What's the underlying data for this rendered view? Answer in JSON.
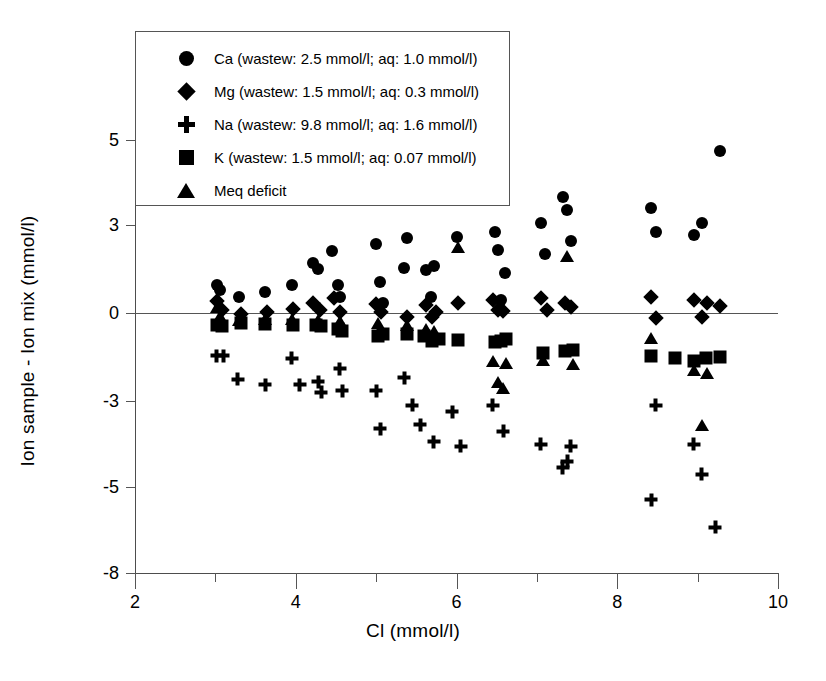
{
  "chart_data": {
    "type": "scatter",
    "title": "",
    "xlabel": "Cl (mmol/l)",
    "ylabel": "Ion sample - Ion mix  (mmol/l)",
    "xlim": [
      2,
      10
    ],
    "ylim": [
      -8,
      6
    ],
    "grid": false,
    "legend_position": "top-left",
    "xticks": [
      {
        "value": 2,
        "label": "2",
        "type": "major"
      },
      {
        "value": 3,
        "label": "",
        "type": "minor"
      },
      {
        "value": 4,
        "label": "4",
        "type": "major"
      },
      {
        "value": 5,
        "label": "",
        "type": "minor"
      },
      {
        "value": 6,
        "label": "6",
        "type": "major"
      },
      {
        "value": 7,
        "label": "",
        "type": "minor"
      },
      {
        "value": 8,
        "label": "8",
        "type": "major"
      },
      {
        "value": 9,
        "label": "",
        "type": "minor"
      },
      {
        "value": 10,
        "label": "10",
        "type": "major"
      }
    ],
    "yticks": [
      {
        "value": 5,
        "label": "5"
      },
      {
        "value": 3,
        "label": "3"
      },
      {
        "value": 0,
        "label": "0"
      },
      {
        "value": -3,
        "label": "-3"
      },
      {
        "value": -5,
        "label": "-5"
      },
      {
        "value": -8,
        "label": "-8"
      }
    ],
    "reference_lines": [
      {
        "axis": "y",
        "value": 0
      }
    ],
    "series": [
      {
        "name": "Ca",
        "marker": "circle",
        "legend_label": "Ca (wastew: 2.5 mmol/l; aq: 1.0 mmol/l)",
        "points": [
          [
            3.02,
            0.95
          ],
          [
            3.06,
            0.8
          ],
          [
            3.3,
            0.55
          ],
          [
            3.62,
            0.72
          ],
          [
            3.95,
            0.95
          ],
          [
            4.22,
            1.7
          ],
          [
            4.28,
            1.5
          ],
          [
            4.45,
            2.1
          ],
          [
            4.52,
            0.95
          ],
          [
            4.55,
            0.55
          ],
          [
            5.0,
            2.35
          ],
          [
            5.05,
            1.05
          ],
          [
            5.08,
            0.35
          ],
          [
            5.35,
            1.55
          ],
          [
            5.38,
            2.55
          ],
          [
            5.62,
            1.45
          ],
          [
            5.68,
            0.55
          ],
          [
            5.72,
            1.6
          ],
          [
            6.0,
            2.6
          ],
          [
            6.48,
            2.75
          ],
          [
            6.52,
            2.15
          ],
          [
            6.55,
            0.45
          ],
          [
            6.6,
            1.35
          ],
          [
            7.05,
            3.05
          ],
          [
            7.1,
            2.0
          ],
          [
            7.32,
            3.65
          ],
          [
            7.38,
            3.35
          ],
          [
            7.42,
            2.45
          ],
          [
            8.42,
            3.4
          ],
          [
            8.48,
            2.75
          ],
          [
            8.95,
            2.65
          ],
          [
            9.05,
            3.05
          ],
          [
            9.28,
            4.75
          ]
        ]
      },
      {
        "name": "Mg",
        "marker": "diamond",
        "legend_label": "Mg (wastew: 1.5 mmol/l; aq: 0.3 mmol/l)",
        "points": [
          [
            3.02,
            0.4
          ],
          [
            3.08,
            0.1
          ],
          [
            3.32,
            -0.05
          ],
          [
            3.64,
            0.05
          ],
          [
            3.96,
            0.12
          ],
          [
            4.22,
            0.35
          ],
          [
            4.3,
            0.1
          ],
          [
            4.48,
            0.5
          ],
          [
            4.55,
            0.05
          ],
          [
            5.0,
            0.3
          ],
          [
            5.06,
            0.05
          ],
          [
            5.38,
            -0.15
          ],
          [
            5.62,
            0.28
          ],
          [
            5.7,
            -0.12
          ],
          [
            5.75,
            0.05
          ],
          [
            6.02,
            0.35
          ],
          [
            6.45,
            0.45
          ],
          [
            6.52,
            0.1
          ],
          [
            6.58,
            0.08
          ],
          [
            7.05,
            0.5
          ],
          [
            7.12,
            0.1
          ],
          [
            7.35,
            0.35
          ],
          [
            7.42,
            0.22
          ],
          [
            8.42,
            0.55
          ],
          [
            8.48,
            -0.18
          ],
          [
            8.95,
            0.45
          ],
          [
            9.05,
            -0.12
          ],
          [
            9.12,
            0.35
          ],
          [
            9.28,
            0.25
          ]
        ]
      },
      {
        "name": "Na",
        "marker": "plus",
        "legend_label": "Na (wastew: 9.8 mmol/l; aq: 1.6 mmol/l)",
        "points": [
          [
            3.02,
            -1.45
          ],
          [
            3.1,
            -1.45
          ],
          [
            3.28,
            -2.25
          ],
          [
            3.62,
            -2.45
          ],
          [
            3.95,
            -1.55
          ],
          [
            4.05,
            -2.45
          ],
          [
            4.28,
            -2.35
          ],
          [
            4.32,
            -2.7
          ],
          [
            4.55,
            -1.9
          ],
          [
            4.58,
            -2.65
          ],
          [
            5.0,
            -2.65
          ],
          [
            5.05,
            -3.65
          ],
          [
            5.35,
            -2.2
          ],
          [
            5.45,
            -3.1
          ],
          [
            5.55,
            -3.55
          ],
          [
            5.72,
            -3.95
          ],
          [
            5.95,
            -3.25
          ],
          [
            6.05,
            -4.05
          ],
          [
            6.45,
            -3.1
          ],
          [
            6.58,
            -3.7
          ],
          [
            7.05,
            -4.0
          ],
          [
            7.32,
            -4.55
          ],
          [
            7.38,
            -4.4
          ],
          [
            7.42,
            -4.05
          ],
          [
            8.42,
            -5.45
          ],
          [
            8.48,
            -3.1
          ],
          [
            8.95,
            -4.0
          ],
          [
            9.05,
            -4.7
          ],
          [
            9.22,
            -6.4
          ]
        ]
      },
      {
        "name": "K",
        "marker": "square",
        "legend_label": "K (wastew: 1.5 mmol/l; aq: 0.07 mmol/l)",
        "points": [
          [
            3.02,
            -0.4
          ],
          [
            3.08,
            -0.45
          ],
          [
            3.32,
            -0.35
          ],
          [
            3.62,
            -0.38
          ],
          [
            3.96,
            -0.4
          ],
          [
            4.25,
            -0.42
          ],
          [
            4.32,
            -0.45
          ],
          [
            4.52,
            -0.55
          ],
          [
            4.58,
            -0.62
          ],
          [
            5.02,
            -0.78
          ],
          [
            5.08,
            -0.72
          ],
          [
            5.38,
            -0.7
          ],
          [
            5.6,
            -0.8
          ],
          [
            5.7,
            -0.95
          ],
          [
            5.78,
            -0.88
          ],
          [
            6.02,
            -0.92
          ],
          [
            6.48,
            -1.0
          ],
          [
            6.55,
            -0.95
          ],
          [
            6.62,
            -0.9
          ],
          [
            7.08,
            -1.35
          ],
          [
            7.35,
            -1.3
          ],
          [
            7.45,
            -1.25
          ],
          [
            8.42,
            -1.45
          ],
          [
            8.72,
            -1.52
          ],
          [
            8.95,
            -1.62
          ],
          [
            9.1,
            -1.55
          ],
          [
            9.28,
            -1.5
          ]
        ]
      },
      {
        "name": "Meq deficit",
        "marker": "triangle",
        "legend_label": "Meq deficit",
        "points": [
          [
            3.02,
            0.2
          ],
          [
            3.06,
            -0.1
          ],
          [
            3.3,
            -0.25
          ],
          [
            3.62,
            -0.2
          ],
          [
            3.95,
            -0.2
          ],
          [
            4.28,
            -0.25
          ],
          [
            4.55,
            -0.28
          ],
          [
            5.02,
            -0.35
          ],
          [
            5.38,
            -0.42
          ],
          [
            5.62,
            -0.55
          ],
          [
            5.72,
            -0.62
          ],
          [
            6.02,
            2.25
          ],
          [
            6.45,
            -1.65
          ],
          [
            6.52,
            -2.35
          ],
          [
            6.58,
            -2.55
          ],
          [
            6.62,
            -1.7
          ],
          [
            7.08,
            -1.6
          ],
          [
            7.38,
            1.95
          ],
          [
            7.45,
            -1.75
          ],
          [
            8.42,
            -0.85
          ],
          [
            8.95,
            -1.95
          ],
          [
            9.05,
            -3.55
          ],
          [
            9.12,
            -2.05
          ]
        ]
      }
    ]
  },
  "axes": {
    "x_title": "Cl (mmol/l)",
    "y_title": "Ion sample - Ion mix  (mmol/l)"
  },
  "legend": {
    "items": [
      {
        "marker": "circle",
        "label": "Ca (wastew: 2.5 mmol/l; aq: 1.0 mmol/l)"
      },
      {
        "marker": "diamond",
        "label": "Mg (wastew: 1.5 mmol/l; aq: 0.3 mmol/l)"
      },
      {
        "marker": "plus",
        "label": "Na (wastew: 9.8 mmol/l; aq: 1.6 mmol/l)"
      },
      {
        "marker": "square",
        "label": "K (wastew: 1.5 mmol/l; aq: 0.07 mmol/l)"
      },
      {
        "marker": "triangle",
        "label": "Meq deficit"
      }
    ]
  },
  "colors": {
    "marker": "#000000",
    "axis": "#555555",
    "background": "#ffffff"
  }
}
